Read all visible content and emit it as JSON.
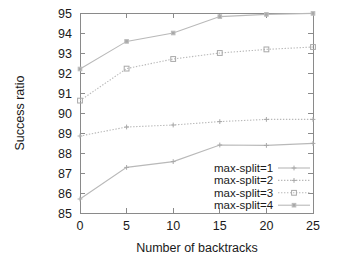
{
  "chart_data": {
    "type": "line",
    "title": "",
    "xlabel": "Number of backtracks",
    "ylabel": "Success ratio",
    "x": [
      0,
      5,
      10,
      15,
      20,
      25
    ],
    "xlim": [
      0,
      25
    ],
    "ylim": [
      85,
      95
    ],
    "xticks": [
      "0",
      "5",
      "10",
      "15",
      "20",
      "25"
    ],
    "yticks": [
      "85",
      "86",
      "87",
      "88",
      "89",
      "90",
      "91",
      "92",
      "93",
      "94",
      "95"
    ],
    "grid": false,
    "legend_position": "lower-right-inside",
    "series": [
      {
        "name": "max-split=1",
        "values": [
          85.7,
          87.28,
          87.57,
          88.4,
          88.38,
          88.48
        ],
        "line_style": "solid",
        "marker": "plus",
        "color": "#b9b9b9"
      },
      {
        "name": "max-split=2",
        "values": [
          88.85,
          89.3,
          89.4,
          89.57,
          89.68,
          89.68
        ],
        "line_style": "dotted",
        "marker": "cross",
        "color": "#b9b9b9"
      },
      {
        "name": "max-split=3",
        "values": [
          90.62,
          92.22,
          92.7,
          93.0,
          93.18,
          93.3
        ],
        "line_style": "dotted",
        "marker": "open-square",
        "color": "#b9b9b9"
      },
      {
        "name": "max-split=4",
        "values": [
          92.2,
          93.58,
          94.0,
          94.82,
          94.93,
          94.98
        ],
        "line_style": "solid",
        "marker": "small-square",
        "color": "#bdbdbd"
      }
    ]
  },
  "legend": {
    "items": [
      {
        "label": "max-split=1"
      },
      {
        "label": "max-split=2"
      },
      {
        "label": "max-split=3"
      },
      {
        "label": "max-split=4"
      }
    ]
  },
  "axes": {
    "y_title": "Success ratio",
    "x_title": "Number of backtracks"
  }
}
